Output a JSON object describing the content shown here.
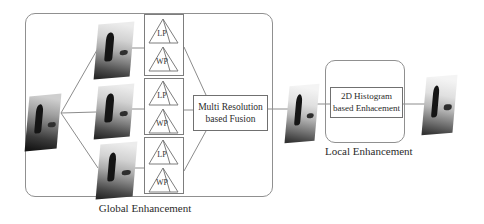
{
  "figure": {
    "global_section": {
      "label": "Global Enhancement",
      "fusion_box": {
        "line1": "Multi Resolution",
        "line2": "based Fusion"
      },
      "pyramid_stacks": [
        {
          "lp": "LP",
          "wp": "WP"
        },
        {
          "lp": "LP",
          "wp": "WP"
        },
        {
          "lp": "LP",
          "wp": "WP"
        }
      ]
    },
    "local_section": {
      "label": "Local Enhancement",
      "box": {
        "line1": "2D Histogram",
        "line2": "based Enhacement"
      }
    },
    "images": [
      {
        "name": "input-photo"
      },
      {
        "name": "scale-1-photo"
      },
      {
        "name": "scale-2-photo"
      },
      {
        "name": "scale-3-photo"
      },
      {
        "name": "globally-enhanced-photo"
      },
      {
        "name": "output-photo"
      }
    ],
    "colors": {
      "line": "#8c8c8c",
      "box_border": "#7d7d7d",
      "rounded_border": "#909090",
      "text": "#2b2b2b",
      "background": "#ffffff"
    }
  }
}
